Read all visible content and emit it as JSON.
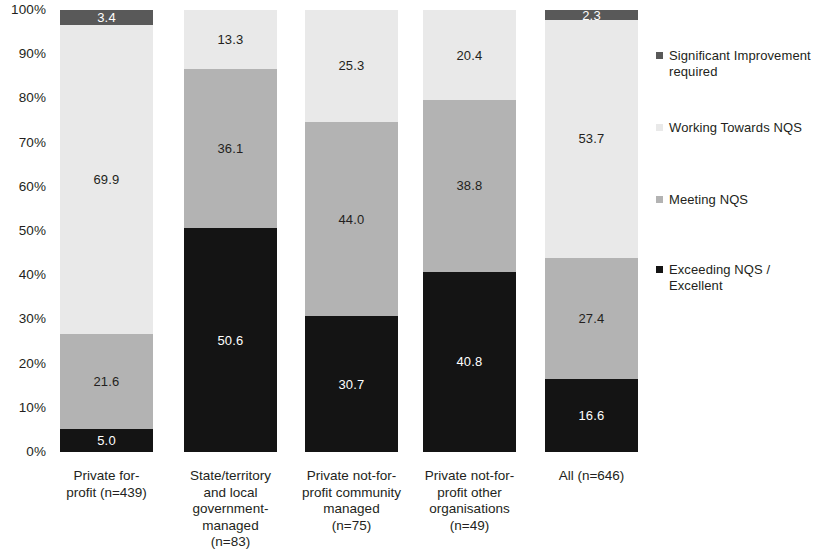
{
  "chart_data": {
    "type": "bar",
    "subtype": "stacked-100-percent-vertical",
    "title": "",
    "subtitle": "",
    "xlabel": "",
    "ylabel": "",
    "ylim": [
      0,
      100
    ],
    "grid": false,
    "legend_position": "right",
    "y_ticks": [
      "0%",
      "10%",
      "20%",
      "30%",
      "40%",
      "50%",
      "60%",
      "70%",
      "80%",
      "90%",
      "100%"
    ],
    "y_tick_values": [
      0,
      10,
      20,
      30,
      40,
      50,
      60,
      70,
      80,
      90,
      100
    ],
    "categories": [
      "Private for-profit (n=439)",
      "State/territory and local government-managed (n=83)",
      "Private not-for-profit community managed (n=75)",
      "Private not-for-profit other organisations (n=49)",
      "All (n=646)"
    ],
    "category_lines": [
      [
        "Private for-",
        "profit (n=439)"
      ],
      [
        "State/territory",
        "and local",
        "government-",
        "managed",
        "(n=83)"
      ],
      [
        "Private not-for-",
        "profit community",
        "managed",
        "(n=75)"
      ],
      [
        "Private not-for-",
        "profit other",
        "organisations",
        "(n=49)"
      ],
      [
        "All (n=646)"
      ]
    ],
    "series": [
      {
        "name": "Exceeding NQS / Excellent",
        "color": "#141414",
        "label_color": "#ffffff",
        "values": [
          5.0,
          50.6,
          30.7,
          40.8,
          16.6
        ],
        "labels": [
          "5.0",
          "50.6",
          "30.7",
          "40.8",
          "16.6"
        ]
      },
      {
        "name": "Meeting NQS",
        "color": "#b3b3b3",
        "label_color": "#231f20",
        "values": [
          21.6,
          36.1,
          44.0,
          38.8,
          27.4
        ],
        "labels": [
          "21.6",
          "36.1",
          "44.0",
          "38.8",
          "27.4"
        ]
      },
      {
        "name": "Working Towards NQS",
        "color": "#e9e9e9",
        "label_color": "#231f20",
        "values": [
          69.9,
          13.3,
          25.3,
          20.4,
          53.7
        ],
        "labels": [
          "69.9",
          "13.3",
          "25.3",
          "20.4",
          "53.7"
        ]
      },
      {
        "name": "Significant Improvement required",
        "color": "#595959",
        "label_color": "#ffffff",
        "values": [
          3.4,
          0,
          0,
          0,
          2.3
        ],
        "labels": [
          "3.4",
          "",
          "",
          "",
          "2.3"
        ]
      }
    ]
  },
  "legend": {
    "items": [
      {
        "label_line1": "Significant Improvement",
        "label_line2": "required",
        "color": "#595959",
        "swatch_name": "legend-swatch-significant-improvement"
      },
      {
        "label_line1": "Working Towards NQS",
        "label_line2": "",
        "color": "#e9e9e9",
        "swatch_name": "legend-swatch-working-towards"
      },
      {
        "label_line1": "Meeting NQS",
        "label_line2": "",
        "color": "#b3b3b3",
        "swatch_name": "legend-swatch-meeting"
      },
      {
        "label_line1": "Exceeding NQS /",
        "label_line2": "Excellent",
        "color": "#141414",
        "swatch_name": "legend-swatch-exceeding"
      }
    ]
  }
}
